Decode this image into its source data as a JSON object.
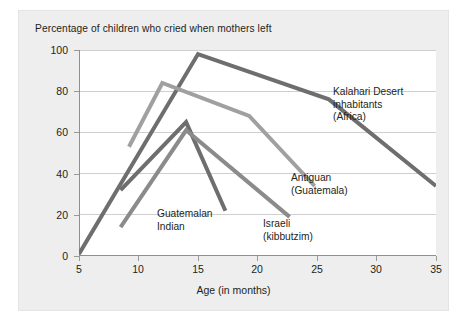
{
  "chart_data": {
    "type": "line",
    "title": "Percentage of children who cried when mothers left",
    "xlabel": "Age (in months)",
    "ylabel": "",
    "xlim": [
      5,
      35
    ],
    "ylim": [
      0,
      100
    ],
    "xticks": [
      5,
      10,
      15,
      20,
      25,
      30,
      35
    ],
    "yticks": [
      0,
      20,
      40,
      60,
      80,
      100
    ],
    "grid": "horizontal",
    "legend": "inline-annotations",
    "series": [
      {
        "name": "Kalahari Desert inhabitants (Africa)",
        "color": "#6e6e6e",
        "label_lines": [
          "Kalahari Desert",
          "inhabitants",
          "(Africa)"
        ],
        "points": [
          [
            5,
            1
          ],
          [
            15,
            98
          ],
          [
            26,
            76
          ],
          [
            35,
            34
          ]
        ]
      },
      {
        "name": "Antiguan (Guatemala)",
        "color": "#a0a0a0",
        "label_lines": [
          "Antiguan",
          "(Guatemala)"
        ],
        "points": [
          [
            9.2,
            53
          ],
          [
            12,
            84
          ],
          [
            19.3,
            68
          ],
          [
            24.8,
            34
          ]
        ]
      },
      {
        "name": "Guatemalan Indian",
        "color": "#6e6e6e",
        "label_lines": [
          "Guatemalan",
          "Indian"
        ],
        "points": [
          [
            8.5,
            32
          ],
          [
            14,
            65
          ],
          [
            17.3,
            22
          ]
        ]
      },
      {
        "name": "Israeli (kibbutzim)",
        "color": "#8b8b8b",
        "label_lines": [
          "Israeli",
          "(kibbutzim)"
        ],
        "points": [
          [
            8.5,
            14
          ],
          [
            14,
            61
          ],
          [
            22.7,
            19
          ]
        ]
      }
    ],
    "annotations": [
      {
        "name": "kalahari",
        "lines": [
          "Kalahari Desert",
          "inhabitants",
          "(Africa)"
        ]
      },
      {
        "name": "antiguan",
        "lines": [
          "Antiguan",
          "(Guatemala)"
        ]
      },
      {
        "name": "guatemalan",
        "lines": [
          "Guatemalan",
          "Indian"
        ]
      },
      {
        "name": "israeli",
        "lines": [
          "Israeli",
          "(kibbutzim)"
        ]
      }
    ]
  },
  "axis": {
    "y": {
      "t100": "100",
      "t80": "80",
      "t60": "60",
      "t40": "40",
      "t20": "20",
      "t0": "0"
    },
    "x": {
      "t5": "5",
      "t10": "10",
      "t15": "15",
      "t20": "20",
      "t25": "25",
      "t30": "30",
      "t35": "35"
    }
  },
  "labels": {
    "kalahari_1": "Kalahari Desert",
    "kalahari_2": "inhabitants",
    "kalahari_3": "(Africa)",
    "antiguan_1": "Antiguan",
    "antiguan_2": "(Guatemala)",
    "guatemalan_1": "Guatemalan",
    "guatemalan_2": "Indian",
    "israeli_1": "Israeli",
    "israeli_2": "(kibbutzim)"
  }
}
